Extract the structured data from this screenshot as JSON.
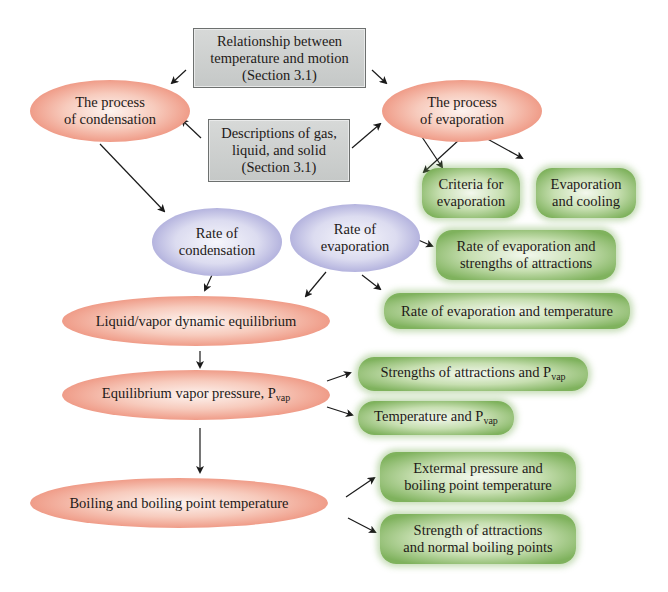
{
  "diagram": {
    "gray_boxes": [
      {
        "id": "temp-motion",
        "lines": [
          "Relationship between",
          "temperature and motion",
          "(Section 3.1)"
        ]
      },
      {
        "id": "gas-liquid-solid",
        "lines": [
          "Descriptions of gas,",
          "liquid, and solid",
          "(Section 3.1)"
        ]
      }
    ],
    "red_nodes": {
      "condensation_process": [
        "The process",
        "of condensation"
      ],
      "evaporation_process": [
        "The process",
        "of evaporation"
      ],
      "dynamic_equilibrium": "Liquid/vapor dynamic equilibrium",
      "vapor_pressure": {
        "text": "Equilibrium vapor pressure, P",
        "sub": "vap"
      },
      "boiling": "Boiling and boiling point temperature"
    },
    "blue_nodes": {
      "rate_condensation": [
        "Rate of",
        "condensation"
      ],
      "rate_evaporation": [
        "Rate of",
        "evaporation"
      ]
    },
    "green_nodes": {
      "criteria": [
        "Criteria for",
        "evaporation"
      ],
      "cooling": [
        "Evaporation",
        "and cooling"
      ],
      "rate_attractions": [
        "Rate of evaporation and",
        "strengths of attractions"
      ],
      "rate_temperature": "Rate of evaporation and temperature",
      "attractions_pvap": {
        "text": "Strengths of attractions and P",
        "sub": "vap"
      },
      "temperature_pvap": {
        "text": "Temperature and P",
        "sub": "vap"
      },
      "external_pressure": [
        "Extermal pressure and",
        "boiling point temperature"
      ],
      "normal_boiling": [
        "Strength of attractions",
        "and normal boiling points"
      ]
    },
    "colors": {
      "gray_box": "#cfd1d0",
      "red_ellipse": "#ef9a86",
      "blue_ellipse": "#a9a8d9",
      "green_box": "#7fb25d",
      "arrow": "#1a1a1a"
    }
  }
}
